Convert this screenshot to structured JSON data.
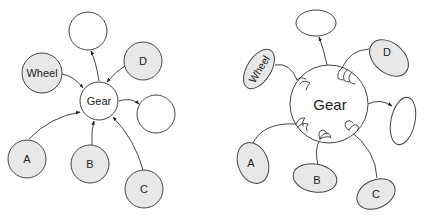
{
  "left_diagram": {
    "gear": {
      "label": "Gear"
    },
    "nodes": {
      "wheel": {
        "label": "Wheel"
      },
      "d": {
        "label": "D"
      },
      "a": {
        "label": "A"
      },
      "b": {
        "label": "B"
      },
      "c": {
        "label": "C"
      },
      "top_empty": {
        "label": ""
      },
      "right_empty": {
        "label": ""
      }
    }
  },
  "right_diagram": {
    "gear": {
      "label": "Gear"
    },
    "nodes": {
      "wheel": {
        "label": "Wheel"
      },
      "d": {
        "label": "D"
      },
      "a": {
        "label": "A"
      },
      "b": {
        "label": "B"
      },
      "c": {
        "label": "C"
      },
      "top_empty": {
        "label": ""
      },
      "right_empty": {
        "label": ""
      }
    }
  },
  "colors": {
    "filled_node": "#e8e8e8",
    "empty_node": "#ffffff",
    "stroke": "#444444"
  }
}
